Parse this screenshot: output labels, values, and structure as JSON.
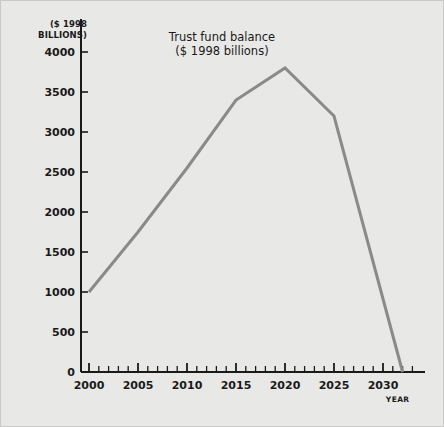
{
  "chart_data": {
    "type": "line",
    "title": "",
    "annotation": {
      "line1": "Trust fund balance",
      "line2": "($ 1998 billions)"
    },
    "ylabel_line1": "($ 1998",
    "ylabel_line2": "BILLIONS)",
    "xlabel": "YEAR",
    "xlim": [
      2000,
      2033
    ],
    "ylim": [
      0,
      4000
    ],
    "yticks": [
      0,
      500,
      1000,
      1500,
      2000,
      2500,
      3000,
      3500,
      4000
    ],
    "ytick_labels": [
      "0",
      "500",
      "1000",
      "1500",
      "2000",
      "2500",
      "3000",
      "3500",
      "4000"
    ],
    "xticks_major": [
      2000,
      2005,
      2010,
      2015,
      2020,
      2025,
      2030
    ],
    "xtick_labels": [
      "2000",
      "2005",
      "2010",
      "2015",
      "2020",
      "2025",
      "2030"
    ],
    "x_minor_tick_interval": 1,
    "grid": false,
    "legend": null,
    "series": [
      {
        "name": "Trust fund balance",
        "color": "#8a8a8a",
        "x": [
          2000,
          2005,
          2010,
          2015,
          2020,
          2025,
          2032
        ],
        "values": [
          1000,
          1750,
          2550,
          3400,
          3800,
          3200,
          0
        ]
      }
    ]
  },
  "figure": {
    "background_color": "#e8e8e6",
    "border_color": "#c9c9c7",
    "axis_color": "#1a1a1a",
    "line_color": "#8a8a8a"
  }
}
